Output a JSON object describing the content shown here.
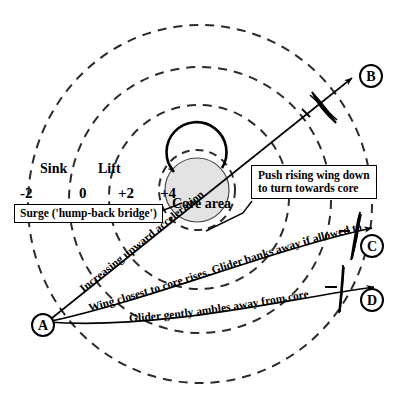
{
  "diagram": {
    "core_label": "Core area",
    "region_labels": {
      "sink": "Sink",
      "lift": "Lift"
    },
    "scale_values": [
      "-2",
      "0",
      "+2",
      "+4"
    ],
    "callouts": [
      {
        "id": "surge",
        "text": "Surge ('hump-back bridge')"
      },
      {
        "id": "push-wing",
        "line1": "Push rising wing down",
        "line2": "to turn towards core"
      }
    ],
    "path_labels": [
      {
        "id": "path-b",
        "text": "Increasing upward acceleration"
      },
      {
        "id": "path-c",
        "text": "Wing closest to core rises. Glider banks away if allowed to"
      },
      {
        "id": "path-d",
        "text": "Glider gently ambles away from core"
      }
    ],
    "markers": [
      {
        "id": "marker-a",
        "label": "A"
      },
      {
        "id": "marker-b",
        "label": "B"
      },
      {
        "id": "marker-c",
        "label": "C"
      },
      {
        "id": "marker-d",
        "label": "D"
      }
    ],
    "colors": {
      "stroke": "#000000",
      "core_fill": "#e0e0e0",
      "background": "#ffffff"
    }
  }
}
